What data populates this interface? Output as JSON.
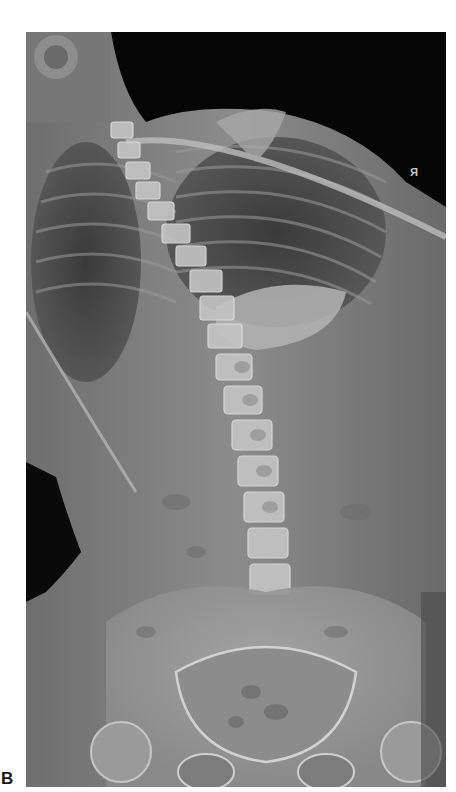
{
  "figure": {
    "panel_label": "B",
    "laterality_marker": "R",
    "colors": {
      "background": "#ffffff",
      "film_dark": "#050505",
      "soft_tissue": "#8a8a8a",
      "bone": "#cfcfcf"
    }
  }
}
